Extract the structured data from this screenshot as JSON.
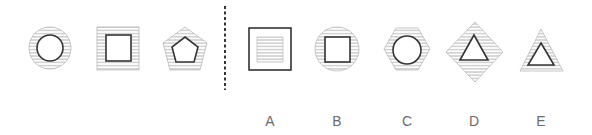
{
  "puzzle": {
    "type": "figure-reasoning",
    "question_figures": [
      {
        "id": "q1",
        "outer_shape": "circle",
        "outer_fill": "hatched",
        "inner_shape": "circle",
        "inner_fill": "white"
      },
      {
        "id": "q2",
        "outer_shape": "square",
        "outer_fill": "hatched",
        "inner_shape": "square",
        "inner_fill": "white"
      },
      {
        "id": "q3",
        "outer_shape": "pentagon",
        "outer_fill": "hatched",
        "inner_shape": "pentagon",
        "inner_fill": "white"
      }
    ],
    "separator": "dashed-vertical-line",
    "options": [
      {
        "label": "A",
        "outer_shape": "square",
        "outer_fill": "white",
        "inner_shape": "square",
        "inner_fill": "hatched"
      },
      {
        "label": "B",
        "outer_shape": "circle",
        "outer_fill": "hatched",
        "inner_shape": "square",
        "inner_fill": "white"
      },
      {
        "label": "C",
        "outer_shape": "hexagon",
        "outer_fill": "hatched",
        "inner_shape": "circle",
        "inner_fill": "white"
      },
      {
        "label": "D",
        "outer_shape": "diamond",
        "outer_fill": "hatched",
        "inner_shape": "triangle",
        "inner_fill": "white"
      },
      {
        "label": "E",
        "outer_shape": "triangle",
        "outer_fill": "hatched",
        "inner_shape": "triangle",
        "inner_fill": "white"
      }
    ]
  },
  "colors": {
    "outline": "#333333",
    "hatch": "#9a9a9a",
    "label": "#6b6b6b",
    "separator": "#333333"
  }
}
